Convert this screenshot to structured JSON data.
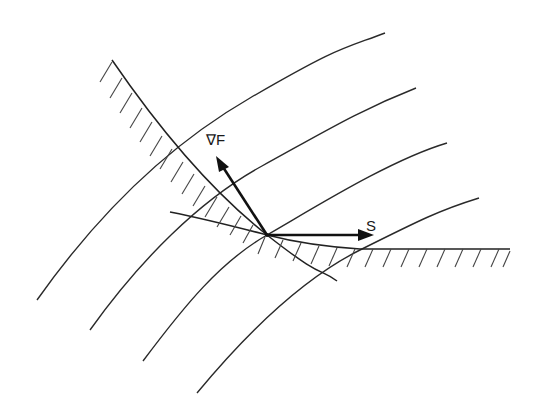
{
  "diagram": {
    "title": "",
    "labels": {
      "gradient": "∇F",
      "search_direction": "S"
    },
    "colors": {
      "background": "#ffffff",
      "ink": "#222222"
    },
    "contours": [
      {
        "id": "contour-1",
        "path": "M37,300 C90,225 160,150 250,98 S340,50 385,33"
      },
      {
        "id": "contour-2",
        "path": "M90,330 C140,260 200,200 262,166 S360,110 416,88"
      },
      {
        "id": "contour-3",
        "path": "M143,361 C185,305 220,262 267,235 S390,160 447,143"
      },
      {
        "id": "contour-4",
        "path": "M197,393 C245,335 300,280 360,250 S440,210 479,198"
      }
    ],
    "constraints": [
      {
        "id": "constraint-a",
        "path": "M112,60 C160,130 210,190 267,235 S320,268 337,281"
      },
      {
        "id": "constraint-b",
        "path": "M170,212 C210,220 240,228 267,235 S330,247 360,249 L510,249"
      }
    ],
    "vectors": {
      "gradient": {
        "x1": 267,
        "y1": 235,
        "x2": 220,
        "y2": 162
      },
      "search_direction": {
        "x1": 267,
        "y1": 235,
        "x2": 368,
        "y2": 235
      }
    },
    "vertex": {
      "x": 267,
      "y": 235
    }
  }
}
